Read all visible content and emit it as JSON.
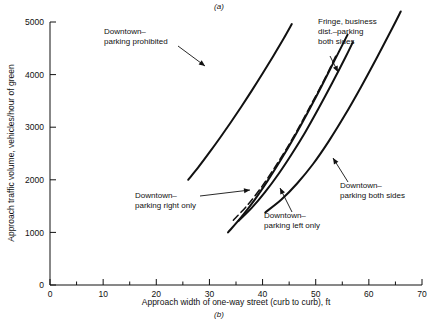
{
  "figure": {
    "caption_top": "(a)",
    "caption_bottom": "(b)"
  },
  "chart_data": {
    "type": "line",
    "title": "",
    "subtitle": "",
    "xlabel": "Approach width of one-way street (curb to curb), ft",
    "ylabel": "Approach traffic volume, vehicles/hour of green",
    "xlim": [
      0,
      70
    ],
    "ylim": [
      0,
      5000
    ],
    "xticks": [
      0,
      10,
      20,
      30,
      40,
      50,
      60,
      70
    ],
    "xtick_labels": [
      "0",
      "10",
      "20",
      "30",
      "40",
      "50",
      "60",
      "70"
    ],
    "xminor_ticks": [
      5,
      15,
      25,
      35,
      45,
      55,
      65
    ],
    "yticks": [
      0,
      1000,
      2000,
      3000,
      4000,
      5000
    ],
    "ytick_labels": [
      "0",
      "1000",
      "2000",
      "3000",
      "4000",
      "5000"
    ],
    "grid": false,
    "legend_position": "annotations-inline",
    "series": [
      {
        "name": "Downtown-parking prohibited",
        "style": "solid",
        "points": [
          [
            26.0,
            2000
          ],
          [
            28.0,
            2250
          ],
          [
            30.0,
            2520
          ],
          [
            32.0,
            2800
          ],
          [
            34.0,
            3090
          ],
          [
            36.0,
            3390
          ],
          [
            38.0,
            3700
          ],
          [
            40.0,
            4020
          ],
          [
            42.0,
            4350
          ],
          [
            44.0,
            4690
          ],
          [
            45.5,
            4960
          ]
        ]
      },
      {
        "name": "Fringe, business dist.-parking both sides",
        "style": "dashed",
        "points": [
          [
            34.5,
            1230
          ],
          [
            37.0,
            1500
          ],
          [
            39.5,
            1820
          ],
          [
            42.0,
            2190
          ],
          [
            44.5,
            2590
          ],
          [
            47.0,
            3030
          ],
          [
            49.5,
            3500
          ],
          [
            52.0,
            3980
          ],
          [
            54.0,
            4400
          ]
        ]
      },
      {
        "name": "Downtown-parking right only",
        "style": "solid",
        "points": [
          [
            33.5,
            1000
          ],
          [
            36.0,
            1290
          ],
          [
            38.5,
            1620
          ],
          [
            41.0,
            1990
          ],
          [
            43.5,
            2390
          ],
          [
            46.0,
            2820
          ],
          [
            48.5,
            3280
          ],
          [
            51.0,
            3760
          ],
          [
            53.5,
            4260
          ],
          [
            56.0,
            4760
          ]
        ]
      },
      {
        "name": "Downtown-parking left only",
        "style": "solid",
        "points": [
          [
            35.5,
            1220
          ],
          [
            38.0,
            1470
          ],
          [
            40.5,
            1770
          ],
          [
            43.0,
            2110
          ],
          [
            45.5,
            2490
          ],
          [
            48.0,
            2900
          ],
          [
            50.5,
            3350
          ],
          [
            53.0,
            3820
          ],
          [
            55.5,
            4310
          ],
          [
            57.0,
            4620
          ]
        ]
      },
      {
        "name": "Downtown-parking both sides",
        "style": "solid",
        "points": [
          [
            40.5,
            1380
          ],
          [
            43.5,
            1620
          ],
          [
            46.5,
            1930
          ],
          [
            49.5,
            2300
          ],
          [
            52.5,
            2740
          ],
          [
            55.5,
            3230
          ],
          [
            58.5,
            3760
          ],
          [
            61.5,
            4320
          ],
          [
            64.5,
            4900
          ],
          [
            66.0,
            5200
          ]
        ]
      }
    ],
    "annotations": [
      {
        "id": "ann-parking-prohibited",
        "lines": [
          "Downtown–",
          "parking prohibited"
        ],
        "text_x": 104,
        "text_y": 34,
        "leader": [
          [
            178,
            46
          ],
          [
            205,
            66
          ]
        ]
      },
      {
        "id": "ann-fringe-business",
        "lines": [
          "Fringe, business",
          "dist.–parking",
          "both sides"
        ],
        "text_x": 318,
        "text_y": 24,
        "leader": [
          [
            330,
            56
          ],
          [
            338,
            72
          ]
        ]
      },
      {
        "id": "ann-parking-right-only",
        "lines": [
          "Downtown–",
          "parking right only"
        ],
        "text_x": 135,
        "text_y": 198,
        "leader": [
          [
            200,
            196
          ],
          [
            250,
            190
          ]
        ]
      },
      {
        "id": "ann-parking-left-only",
        "lines": [
          "Downtown–",
          "parking left only"
        ],
        "text_x": 264,
        "text_y": 218,
        "leader": [
          [
            292,
            212
          ],
          [
            280,
            188
          ]
        ]
      },
      {
        "id": "ann-parking-both-sides",
        "lines": [
          "Downtown–",
          "parking both sides"
        ],
        "text_x": 340,
        "text_y": 188,
        "leader": [
          [
            348,
            182
          ],
          [
            333,
            158
          ]
        ]
      }
    ]
  }
}
